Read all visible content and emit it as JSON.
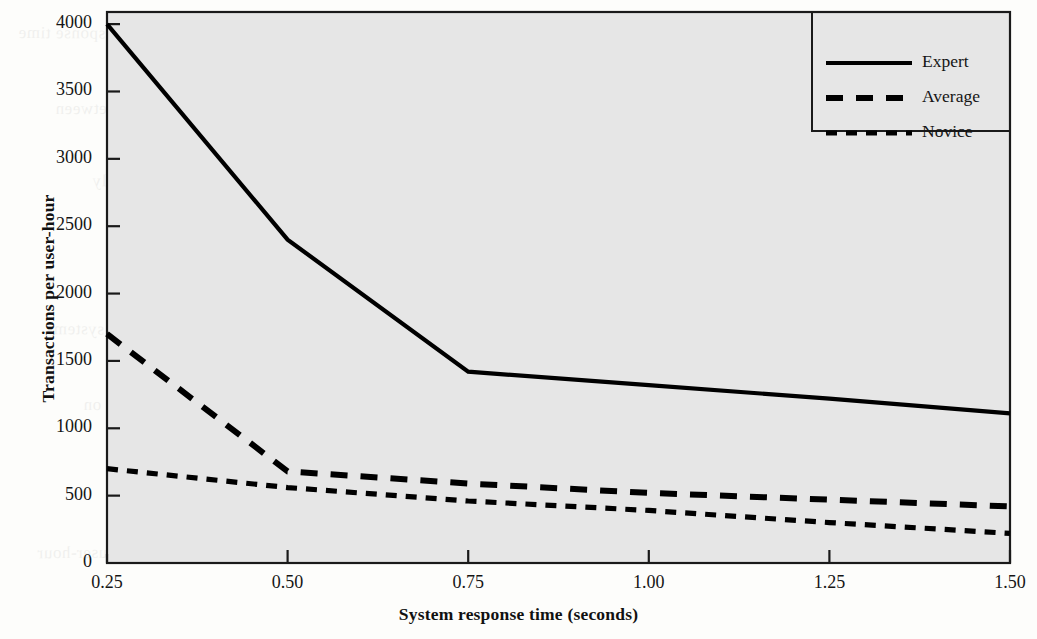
{
  "figure": {
    "plot_background": "#e6e6e6",
    "axis_color": "#1a1a1a",
    "line_color": "#000000"
  },
  "chart_data": {
    "type": "line",
    "title": "",
    "xlabel": "System response time (seconds)",
    "ylabel": "Transactions per user-hour",
    "x": [
      0.25,
      0.5,
      0.75,
      1.0,
      1.25,
      1.5
    ],
    "xtick_labels": [
      "0.25",
      "0.50",
      "0.75",
      "1.00",
      "1.25",
      "1.50"
    ],
    "ytick_labels": [
      "0",
      "500",
      "1000",
      "1500",
      "2000",
      "2500",
      "3000",
      "3500",
      "4000"
    ],
    "ytick_values": [
      0,
      500,
      1000,
      1500,
      2000,
      2500,
      3000,
      3500,
      4000
    ],
    "xlim": [
      0.25,
      1.5
    ],
    "ylim": [
      0,
      4090
    ],
    "grid": false,
    "legend_position": "top-right",
    "series": [
      {
        "name": "Expert",
        "style": "solid",
        "values": [
          4000,
          2400,
          1420,
          1320,
          1220,
          1110
        ]
      },
      {
        "name": "Average",
        "style": "dashed",
        "values": [
          1700,
          680,
          590,
          520,
          470,
          420
        ]
      },
      {
        "name": "Novice",
        "style": "dotted",
        "values": [
          700,
          560,
          460,
          390,
          300,
          220
        ]
      }
    ]
  },
  "legend": {
    "entries": [
      {
        "label": "Expert",
        "style": "solid"
      },
      {
        "label": "Average",
        "style": "dashed"
      },
      {
        "label": "Novice",
        "style": "dotted"
      }
    ]
  },
  "page_texture": {
    "lines": [
      "a general treatment of the problem of response time",
      "system response time is the interval between",
      "the user's request and the system's reply",
      "shorter response times lead to higher productivity",
      "for experienced users of interactive systems",
      "the effect of these productivity gains on",
      "throughput of data entry and retrieval tasks",
      "measured in transactions completed per user-hour"
    ]
  }
}
